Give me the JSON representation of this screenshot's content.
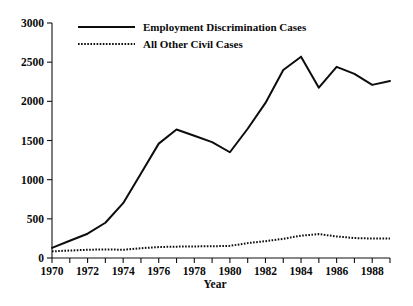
{
  "chart_data": {
    "type": "line",
    "title": "",
    "xlabel": "Year",
    "ylabel": "",
    "xlim": [
      1970,
      1989
    ],
    "ylim": [
      0,
      3000
    ],
    "grid": false,
    "legend_position": "top-left-inside",
    "y_ticks": [
      0,
      500,
      1000,
      1500,
      2000,
      2500,
      3000
    ],
    "y_tick_labels": [
      "0",
      "500",
      "1000",
      "1500",
      "2000",
      "2500",
      "3000"
    ],
    "x_ticks": [
      1970,
      1971,
      1972,
      1973,
      1974,
      1975,
      1976,
      1977,
      1978,
      1979,
      1980,
      1981,
      1982,
      1983,
      1984,
      1985,
      1986,
      1987,
      1988,
      1989
    ],
    "x_tick_labels_shown": [
      "1970",
      "1972",
      "1974",
      "1976",
      "1978",
      "1980",
      "1982",
      "1984",
      "1986",
      "1988"
    ],
    "x": [
      1970,
      1971,
      1972,
      1973,
      1974,
      1975,
      1976,
      1977,
      1978,
      1979,
      1980,
      1981,
      1982,
      1983,
      1984,
      1985,
      1986,
      1987,
      1988,
      1989
    ],
    "series": [
      {
        "name": "Employment Discrimination Cases",
        "style": "solid",
        "color": "#0d0d0d",
        "values": [
          130,
          220,
          310,
          450,
          700,
          1080,
          1460,
          1640,
          1560,
          1480,
          1350,
          1650,
          1980,
          2400,
          2570,
          2175,
          2440,
          2350,
          2210,
          2260
        ]
      },
      {
        "name": "All Other Civil Cases",
        "style": "dotted",
        "color": "#0d0d0d",
        "values": [
          85,
          95,
          105,
          110,
          105,
          125,
          140,
          145,
          148,
          150,
          155,
          190,
          215,
          245,
          285,
          305,
          275,
          255,
          248,
          250
        ]
      }
    ]
  },
  "axes": {
    "y_axis_name": "case-count-axis",
    "x_axis_name": "year-axis"
  }
}
